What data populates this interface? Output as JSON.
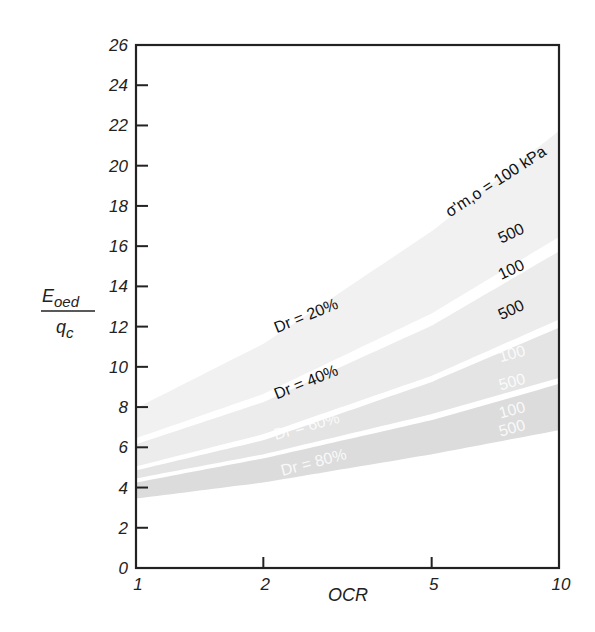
{
  "chart_data": {
    "type": "area",
    "title": "",
    "xlabel": "OCR",
    "ylabel_numerator": "E_oed",
    "ylabel_denominator": "q_c",
    "ylabel": "E_oed / q_c",
    "x_scale": "log",
    "xlim": [
      1,
      10
    ],
    "ylim": [
      0,
      26
    ],
    "x_ticks": [
      1,
      2,
      5,
      10
    ],
    "x_tick_labels": [
      "1",
      "2",
      "5",
      "10"
    ],
    "y_ticks": [
      0,
      2,
      4,
      6,
      8,
      10,
      12,
      14,
      16,
      18,
      20,
      22,
      24,
      26
    ],
    "y_tick_labels": [
      "0",
      "2",
      "4",
      "6",
      "8",
      "10",
      "12",
      "14",
      "16",
      "18",
      "20",
      "22",
      "24",
      "26"
    ],
    "grid": false,
    "legend": "none (inline annotations)",
    "x": [
      1,
      2,
      5,
      10
    ],
    "series": [
      {
        "name": "Dr = 20%, σ'm,o = 100 kPa",
        "values": [
          8.0,
          11.2,
          16.8,
          21.8
        ]
      },
      {
        "name": "Dr = 20%, σ'm,o = 500 kPa",
        "values": [
          6.4,
          8.6,
          12.6,
          16.4
        ]
      },
      {
        "name": "Dr = 40%, σ'm,o = 100 kPa",
        "values": [
          6.2,
          8.3,
          12.1,
          15.8
        ]
      },
      {
        "name": "Dr = 40%, σ'm,o = 500 kPa",
        "values": [
          5.0,
          6.6,
          9.5,
          12.3
        ]
      },
      {
        "name": "Dr = 60%, σ'm,o = 100 kPa",
        "values": [
          4.9,
          6.4,
          9.3,
          12.0
        ]
      },
      {
        "name": "Dr = 60%, σ'm,o = 500 kPa",
        "values": [
          4.4,
          5.6,
          7.6,
          9.4
        ]
      },
      {
        "name": "Dr = 80%, σ'm,o = 100 kPa",
        "values": [
          4.3,
          5.5,
          7.4,
          9.2
        ]
      },
      {
        "name": "Dr = 80%, σ'm,o = 500 kPa",
        "values": [
          3.4,
          4.2,
          5.6,
          6.8
        ]
      }
    ],
    "bands": [
      {
        "label": "Dr = 20%",
        "upper_series": 0,
        "lower_series": 1,
        "fill": "#f1f1f1"
      },
      {
        "label": "Dr = 40%",
        "upper_series": 2,
        "lower_series": 3,
        "fill": "#ececec"
      },
      {
        "label": "Dr = 60%",
        "upper_series": 4,
        "lower_series": 5,
        "fill": "#e4e4e4"
      },
      {
        "label": "Dr = 80%",
        "upper_series": 6,
        "lower_series": 7,
        "fill": "#dcdcdc"
      }
    ],
    "annotations": [
      {
        "text": "σ'm,o = 100 kPa",
        "x": 7.2,
        "y": 19.0,
        "rotate": -33,
        "style": "dark"
      },
      {
        "text": "500",
        "x": 7.8,
        "y": 16.4,
        "rotate": -25,
        "style": "dark"
      },
      {
        "text": "100",
        "x": 7.8,
        "y": 14.6,
        "rotate": -25,
        "style": "dark"
      },
      {
        "text": "500",
        "x": 7.8,
        "y": 12.6,
        "rotate": -25,
        "style": "dark"
      },
      {
        "text": "100",
        "x": 7.8,
        "y": 10.4,
        "rotate": -15,
        "style": "light"
      },
      {
        "text": "500",
        "x": 7.8,
        "y": 9.0,
        "rotate": -15,
        "style": "light"
      },
      {
        "text": "100",
        "x": 7.8,
        "y": 7.6,
        "rotate": -15,
        "style": "light"
      },
      {
        "text": "500",
        "x": 7.8,
        "y": 6.7,
        "rotate": -15,
        "style": "light"
      },
      {
        "text": "Dr = 20%",
        "x": 2.55,
        "y": 12.3,
        "rotate": -22,
        "style": "dark"
      },
      {
        "text": "Dr = 40%",
        "x": 2.55,
        "y": 9.0,
        "rotate": -22,
        "style": "dark"
      },
      {
        "text": "Dr = 60%",
        "x": 2.55,
        "y": 6.8,
        "rotate": -15,
        "style": "light"
      },
      {
        "text": "Dr = 80%",
        "x": 2.65,
        "y": 5.0,
        "rotate": -15,
        "style": "light"
      }
    ]
  },
  "axes": {
    "x_title": "OCR",
    "y_title_numerator_main": "E",
    "y_title_numerator_sub": "oed",
    "y_title_denominator_main": "q",
    "y_title_denominator_sub": "c"
  },
  "colors": {
    "axis": "#222222",
    "band_line": "#ffffff"
  }
}
